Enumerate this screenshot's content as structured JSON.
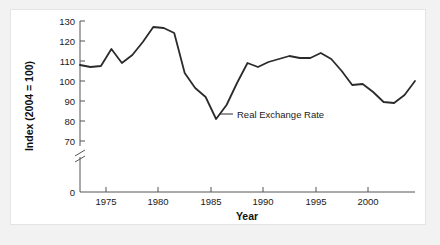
{
  "chart_data": {
    "type": "line",
    "title": "",
    "xlabel": "Year",
    "ylabel": "Index (2004 = 100)",
    "xlim": [
      1972,
      2004
    ],
    "ylim": [
      70,
      130
    ],
    "y_axis_break": true,
    "y_axis_break_between": [
      0,
      70
    ],
    "grid": false,
    "legend_position": "inline-annotation",
    "xticks": [
      1975,
      1980,
      1985,
      1990,
      1995,
      2000
    ],
    "xtick_labels": [
      "1975",
      "1980",
      "1985",
      "1990",
      "1995",
      "2000"
    ],
    "yticks": [
      0,
      70,
      80,
      90,
      100,
      110,
      120,
      130
    ],
    "ytick_labels": [
      "0",
      "70",
      "80",
      "90",
      "100",
      "110",
      "120",
      "130"
    ],
    "annotations": [
      {
        "text": "Real Exchange Rate",
        "x": 1986.5,
        "y": 89
      }
    ],
    "series": [
      {
        "name": "Real Exchange Rate",
        "color": "#2b2b2b",
        "x": [
          1972,
          1973,
          1974,
          1975,
          1976,
          1977,
          1978,
          1979,
          1980,
          1981,
          1982,
          1983,
          1984,
          1985,
          1986,
          1987,
          1988,
          1989,
          1990,
          1991,
          1992,
          1993,
          1994,
          1995,
          1996,
          1997,
          1998,
          1999,
          2000,
          2001,
          2002,
          2003,
          2004
        ],
        "values": [
          108,
          107,
          107.5,
          116,
          109,
          113,
          119.5,
          127,
          126.5,
          124,
          104,
          96.5,
          92,
          81,
          88,
          99,
          109,
          107,
          109.5,
          111,
          112.5,
          111.5,
          111.5,
          114,
          111,
          105,
          98,
          98.5,
          94.5,
          89.5,
          89,
          93,
          100
        ]
      }
    ]
  },
  "labels": {
    "y_axis_title": "Index (2004 = 100)",
    "x_axis_title": "Year",
    "series_label": "Real Exchange Rate"
  },
  "colors": {
    "page_background": "#f2f2f2",
    "panel_background": "#ffffff",
    "panel_border": "#e4e4e4",
    "axis": "#555555",
    "line": "#2b2b2b",
    "text": "#1a1a1a"
  }
}
